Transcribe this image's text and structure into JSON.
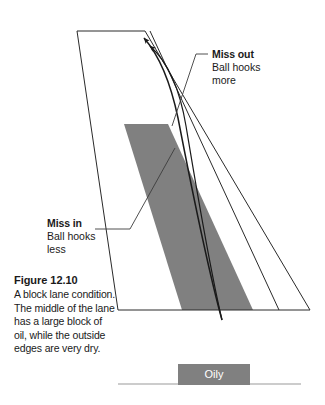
{
  "figure": {
    "caption_title": "Figure 12.10",
    "caption_body": "A block lane condition. The middle of the lane has a large block of oil, while the outside edges are very dry."
  },
  "callouts": {
    "miss_out": {
      "title": "Miss out",
      "line1": "Ball hooks",
      "line2": "more"
    },
    "miss_in": {
      "title": "Miss in",
      "line1": "Ball hooks",
      "line2": "less"
    }
  },
  "legend": {
    "oily_label": "Oily"
  },
  "colors": {
    "oil_block": "#808080",
    "line": "#1a1a1a",
    "leader": "#3c3c3c",
    "baseline": "#999999",
    "background": "#ffffff",
    "text": "#1a1a1a",
    "legend_text": "#ffffff"
  }
}
